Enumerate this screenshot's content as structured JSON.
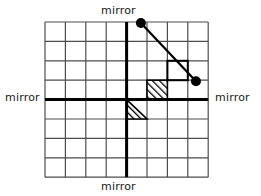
{
  "figure": {
    "title_absent": true,
    "labels": {
      "top": "mirror",
      "bottom": "mirror",
      "left": "mirror",
      "right": "mirror"
    },
    "colors": {
      "grid_line": "#4d4d4d",
      "mirror_line": "#000000",
      "ray": "#000000",
      "dot": "#000000",
      "hatch": "#000000",
      "background": "#ffffff"
    },
    "grid": {
      "columns": 8,
      "rows": 8,
      "x0": 45,
      "y0": 22,
      "cell_width": 20.4,
      "cell_height": 19.4,
      "thin_line_width": 1.2,
      "bold_line_width": 3.0
    },
    "mirrors": [
      {
        "name": "vertical-mirror",
        "orientation": "vertical",
        "grid_index": 4
      },
      {
        "name": "horizontal-mirror",
        "orientation": "horizontal",
        "grid_index": 4
      }
    ],
    "hatched_cells": [
      {
        "name": "hatched-square",
        "col": 5,
        "row": 3,
        "shape": "full-square"
      },
      {
        "name": "hatched-triangle",
        "col": 4,
        "row": 4,
        "shape": "lower-left-triangle"
      }
    ],
    "outlined_cells": [
      {
        "name": "outlined-square",
        "col": 6,
        "row": 2
      }
    ],
    "ray": {
      "name": "light-ray",
      "from": {
        "col": 4.7,
        "row": 0.05
      },
      "to": {
        "col": 7.4,
        "row": 3.05
      },
      "stroke_width": 2.2
    },
    "endpoints": [
      {
        "name": "ray-start-dot",
        "col": 4.7,
        "row": 0.05,
        "radius": 5.0
      },
      {
        "name": "ray-end-dot",
        "col": 7.4,
        "row": 3.05,
        "radius": 5.0
      }
    ]
  }
}
